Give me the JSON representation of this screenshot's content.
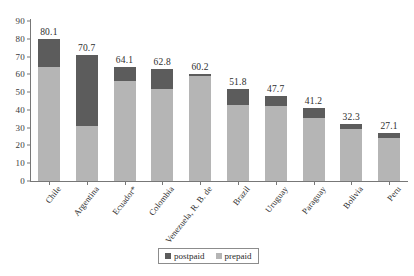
{
  "chart_data": {
    "type": "bar",
    "subtype": "stacked-vertical",
    "title": "",
    "subtitle": "",
    "xlabel": "",
    "ylabel": "",
    "ylim": [
      0,
      90
    ],
    "yticks": [
      0,
      10,
      20,
      30,
      40,
      50,
      60,
      70,
      80,
      90
    ],
    "grid": false,
    "legend_position": "bottom-center",
    "categories": [
      "Chile",
      "Argentina",
      "Ecuador*",
      "Colombia",
      "Venezuela, R. B. de",
      "Brazil",
      "Uruguay",
      "Paraguay",
      "Bolivia",
      "Peru"
    ],
    "series": [
      {
        "name": "prepaid",
        "color": "#b5b5b5",
        "values": [
          64.3,
          31.0,
          56.5,
          52.0,
          59.2,
          42.6,
          42.0,
          35.4,
          29.4,
          24.1
        ]
      },
      {
        "name": "postpaid",
        "color": "#5c5c5c",
        "values": [
          15.8,
          39.7,
          7.6,
          10.8,
          1.0,
          9.2,
          5.7,
          5.8,
          2.9,
          3.0
        ]
      }
    ],
    "totals": [
      80.1,
      70.7,
      64.1,
      62.8,
      60.2,
      51.8,
      47.7,
      41.2,
      32.3,
      27.1
    ],
    "data_labels": [
      "80.1",
      "70.7",
      "64.1",
      "62.8",
      "60.2",
      "51.8",
      "47.7",
      "41.2",
      "32.3",
      "27.1"
    ],
    "tick_labels": [
      "0",
      "10",
      "20",
      "30",
      "40",
      "50",
      "60",
      "70",
      "80",
      "90"
    ]
  },
  "legend": {
    "items": [
      {
        "label": "postpaid",
        "color": "#5c5c5c"
      },
      {
        "label": "prepaid",
        "color": "#b5b5b5"
      }
    ]
  },
  "colors": {
    "postpaid": "#5c5c5c",
    "prepaid": "#b5b5b5",
    "axis": "#777777",
    "text": "#2e2e2e",
    "background": "#ffffff"
  }
}
